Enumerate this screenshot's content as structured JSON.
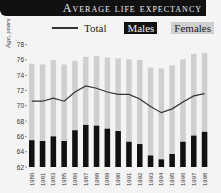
{
  "title": "Average life expectancy",
  "legend": {
    "total": "Total",
    "males": "Males",
    "females": "Females"
  },
  "colors": {
    "males": "#111111",
    "females": "#cfcfcf",
    "total": "#333333",
    "title_bg": "#111111"
  },
  "chart_data": {
    "type": "bar",
    "title": "Average life expectancy",
    "xlabel": "",
    "ylabel": "Age, years",
    "ylim": [
      62,
      78
    ],
    "yticks": [
      62,
      64,
      66,
      68,
      70,
      72,
      74,
      76,
      78
    ],
    "grid": false,
    "legend_position": "top",
    "categories": [
      "1980",
      "1981",
      "1983",
      "1985",
      "1986",
      "1987",
      "1988",
      "1989",
      "1990",
      "1991",
      "1992",
      "1993",
      "1994",
      "1995",
      "1996",
      "1997",
      "1998"
    ],
    "series": [
      {
        "name": "Males",
        "type": "bar",
        "values": [
          65.5,
          65.4,
          66.0,
          65.4,
          66.8,
          67.5,
          67.4,
          67.0,
          66.7,
          65.3,
          65.0,
          63.5,
          63.0,
          63.7,
          65.3,
          66.1,
          66.6
        ]
      },
      {
        "name": "Females",
        "type": "bar",
        "values": [
          75.5,
          75.4,
          76.0,
          75.4,
          75.9,
          76.4,
          76.5,
          76.3,
          76.2,
          76.1,
          76.0,
          75.0,
          74.9,
          75.3,
          76.1,
          76.8,
          76.9
        ]
      },
      {
        "name": "Total",
        "type": "line",
        "values": [
          70.6,
          70.6,
          71.0,
          70.6,
          71.8,
          72.6,
          72.3,
          71.8,
          71.5,
          71.5,
          70.9,
          69.9,
          69.1,
          69.6,
          70.5,
          71.3,
          71.6
        ]
      }
    ]
  }
}
